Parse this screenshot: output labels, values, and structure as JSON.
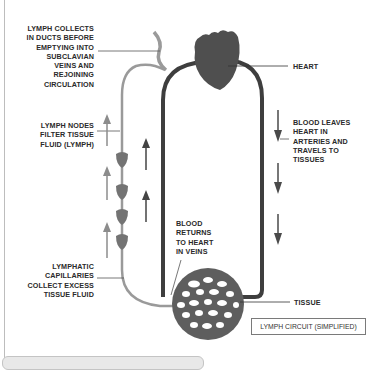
{
  "diagram": {
    "title": "LYMPH CIRCUIT (SIMPLIFIED)",
    "labels": {
      "lymph_ducts": [
        "LYMPH COLLECTS",
        "IN DUCTS BEFORE",
        "EMPTYING INTO",
        "SUBCLAVIAN",
        "VEINS AND",
        "REJOINING",
        "CIRCULATION"
      ],
      "heart": "HEART",
      "lymph_nodes": [
        "LYMPH NODES",
        "FILTER TISSUE",
        "FLUID (LYMPH)"
      ],
      "arteries": [
        "BLOOD LEAVES",
        "HEART IN",
        "ARTERIES AND",
        "TRAVELS TO",
        "TISSUES"
      ],
      "veins": [
        "BLOOD",
        "RETURNS",
        "TO HEART",
        "IN VEINS"
      ],
      "capillaries": [
        "LYMPHATIC",
        "CAPILLARIES",
        "COLLECT EXCESS",
        "TISSUE FLUID"
      ],
      "tissue": "TISSUE"
    },
    "colors": {
      "blood_vessel": "#3a3a3a",
      "lymph_vessel": "#8c8c8c",
      "heart": "#4a4a4a",
      "lymph_node": "#707070",
      "tissue": "#5c5c5c"
    }
  }
}
